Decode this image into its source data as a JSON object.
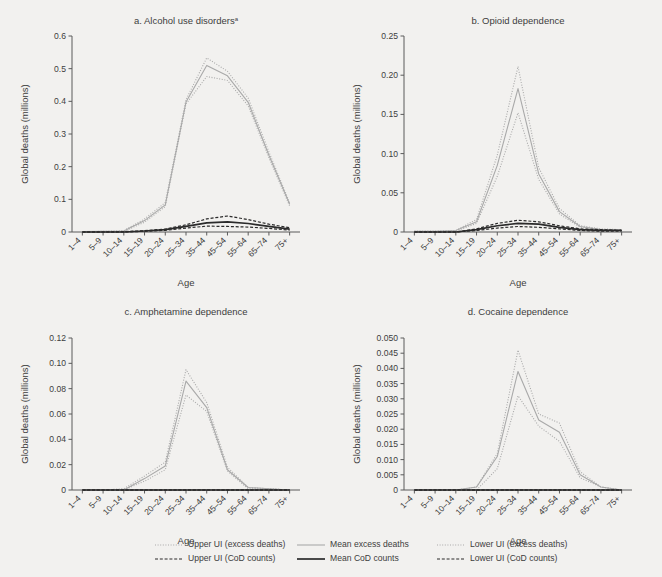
{
  "figure": {
    "background_color": "#f2f1ef",
    "axis_color": "#5a5a5a",
    "text_color": "#3d3d3d",
    "excess_color": "#a9a9a9",
    "cod_color": "#2b2b2b",
    "x_axis_label": "Age",
    "y_axis_label": "Global deaths (millions)",
    "categories": [
      "1–4",
      "5–9",
      "10–14",
      "15–19",
      "20–24",
      "25–34",
      "35–44",
      "45–54",
      "55–64",
      "65–74",
      "75+"
    ]
  },
  "legend": {
    "items": [
      {
        "label": "Upper UI (excess deaths)",
        "style": "dotted",
        "color": "#a9a9a9",
        "icon": "dotted-line-icon"
      },
      {
        "label": "Mean excess deaths",
        "style": "solid-thin",
        "color": "#a9a9a9",
        "icon": "solid-line-icon"
      },
      {
        "label": "Lower UI (excess deaths)",
        "style": "dotted",
        "color": "#a9a9a9",
        "icon": "dotted-line-icon"
      },
      {
        "label": "Upper UI (CoD counts)",
        "style": "dashed",
        "color": "#2b2b2b",
        "icon": "dashed-line-icon"
      },
      {
        "label": "Mean CoD counts",
        "style": "solid-thick",
        "color": "#2b2b2b",
        "icon": "solid-line-icon"
      },
      {
        "label": "Lower UI (CoD counts)",
        "style": "dashed",
        "color": "#2b2b2b",
        "icon": "dashed-line-icon"
      }
    ]
  },
  "chart_data": [
    {
      "id": "panel-a",
      "type": "line",
      "title": "a. Alcohol use disorders",
      "title_superscript": "a",
      "xlabel": "Age",
      "ylabel": "Global deaths (millions)",
      "categories": [
        "1–4",
        "5–9",
        "10–14",
        "15–19",
        "20–24",
        "25–34",
        "35–44",
        "45–54",
        "55–64",
        "65–74",
        "75+"
      ],
      "ylim": [
        0,
        0.6
      ],
      "yticks": [
        0,
        0.1,
        0.2,
        0.3,
        0.4,
        0.5,
        0.6
      ],
      "ytick_labels": [
        "0",
        "0.1",
        "0.2",
        "0.3",
        "0.4",
        "0.5",
        "0.6"
      ],
      "grid": false,
      "series": [
        {
          "name": "Upper UI (excess deaths)",
          "style": "dotted",
          "color": "#a9a9a9",
          "values": [
            0.001,
            0.002,
            0.004,
            0.04,
            0.09,
            0.405,
            0.533,
            0.492,
            0.41,
            0.245,
            0.09
          ]
        },
        {
          "name": "Mean excess deaths",
          "style": "solid-thin",
          "color": "#a9a9a9",
          "values": [
            0.001,
            0.002,
            0.003,
            0.035,
            0.083,
            0.398,
            0.51,
            0.478,
            0.397,
            0.235,
            0.085
          ]
        },
        {
          "name": "Lower UI (excess deaths)",
          "style": "dotted",
          "color": "#a9a9a9",
          "values": [
            0.001,
            0.001,
            0.002,
            0.03,
            0.078,
            0.392,
            0.476,
            0.464,
            0.386,
            0.228,
            0.08
          ]
        },
        {
          "name": "Upper UI (CoD counts)",
          "style": "dashed",
          "color": "#2b2b2b",
          "values": [
            0.0,
            0.0,
            0.001,
            0.004,
            0.009,
            0.022,
            0.04,
            0.049,
            0.038,
            0.024,
            0.013
          ]
        },
        {
          "name": "Mean CoD counts",
          "style": "solid-thick",
          "color": "#2b2b2b",
          "values": [
            0.0,
            0.0,
            0.0,
            0.003,
            0.007,
            0.017,
            0.028,
            0.031,
            0.026,
            0.017,
            0.009
          ]
        },
        {
          "name": "Lower UI (CoD counts)",
          "style": "dashed",
          "color": "#2b2b2b",
          "values": [
            0.0,
            0.0,
            0.0,
            0.002,
            0.005,
            0.012,
            0.018,
            0.017,
            0.015,
            0.011,
            0.006
          ]
        }
      ]
    },
    {
      "id": "panel-b",
      "type": "line",
      "title": "b. Opioid dependence",
      "title_superscript": "",
      "xlabel": "Age",
      "ylabel": "Global deaths (millions)",
      "categories": [
        "1–4",
        "5–9",
        "10–14",
        "15–19",
        "20–24",
        "25–34",
        "35–44",
        "45–54",
        "55–64",
        "65–74",
        "75+"
      ],
      "ylim": [
        0,
        0.25
      ],
      "yticks": [
        0,
        0.05,
        0.1,
        0.15,
        0.2,
        0.25
      ],
      "ytick_labels": [
        "0",
        "0.05",
        "0.10",
        "0.15",
        "0.20",
        "0.25"
      ],
      "grid": false,
      "series": [
        {
          "name": "Upper UI (excess deaths)",
          "style": "dotted",
          "color": "#a9a9a9",
          "values": [
            0.001,
            0.001,
            0.002,
            0.016,
            0.098,
            0.211,
            0.082,
            0.03,
            0.008,
            0.004,
            0.003
          ]
        },
        {
          "name": "Mean excess deaths",
          "style": "solid-thin",
          "color": "#a9a9a9",
          "values": [
            0.001,
            0.001,
            0.002,
            0.013,
            0.085,
            0.183,
            0.074,
            0.026,
            0.007,
            0.003,
            0.002
          ]
        },
        {
          "name": "Lower UI (excess deaths)",
          "style": "dotted",
          "color": "#a9a9a9",
          "values": [
            0.001,
            0.001,
            0.001,
            0.011,
            0.071,
            0.152,
            0.067,
            0.023,
            0.006,
            0.003,
            0.002
          ]
        },
        {
          "name": "Upper UI (CoD counts)",
          "style": "dashed",
          "color": "#2b2b2b",
          "values": [
            0.0,
            0.0,
            0.0,
            0.004,
            0.011,
            0.015,
            0.013,
            0.008,
            0.004,
            0.003,
            0.002
          ]
        },
        {
          "name": "Mean CoD counts",
          "style": "solid-thick",
          "color": "#2b2b2b",
          "values": [
            0.0,
            0.0,
            0.0,
            0.003,
            0.008,
            0.011,
            0.01,
            0.006,
            0.003,
            0.002,
            0.002
          ]
        },
        {
          "name": "Lower UI (CoD counts)",
          "style": "dashed",
          "color": "#2b2b2b",
          "values": [
            0.0,
            0.0,
            0.0,
            0.002,
            0.005,
            0.007,
            0.006,
            0.004,
            0.002,
            0.001,
            0.001
          ]
        }
      ]
    },
    {
      "id": "panel-c",
      "type": "line",
      "title": "c. Amphetamine dependence",
      "title_superscript": "",
      "xlabel": "Age",
      "ylabel": "Global deaths (millions)",
      "categories": [
        "1–4",
        "5–9",
        "10–14",
        "15–19",
        "20–24",
        "25–34",
        "35–44",
        "45–54",
        "55–64",
        "65–74",
        "75+"
      ],
      "ylim": [
        0,
        0.12
      ],
      "yticks": [
        0,
        0.02,
        0.04,
        0.06,
        0.08,
        0.1,
        0.12
      ],
      "ytick_labels": [
        "0",
        "0.02",
        "0.04",
        "0.06",
        "0.08",
        "0.10",
        "0.12"
      ],
      "grid": false,
      "series": [
        {
          "name": "Upper UI (excess deaths)",
          "style": "dotted",
          "color": "#a9a9a9",
          "values": [
            0.0,
            0.0,
            0.001,
            0.011,
            0.022,
            0.095,
            0.069,
            0.018,
            0.002,
            0.001,
            0.0
          ]
        },
        {
          "name": "Mean excess deaths",
          "style": "solid-thin",
          "color": "#a9a9a9",
          "values": [
            0.0,
            0.0,
            0.0,
            0.009,
            0.019,
            0.086,
            0.065,
            0.016,
            0.002,
            0.001,
            0.0
          ]
        },
        {
          "name": "Lower UI (excess deaths)",
          "style": "dotted",
          "color": "#a9a9a9",
          "values": [
            0.0,
            0.0,
            0.0,
            0.007,
            0.016,
            0.075,
            0.062,
            0.015,
            0.001,
            0.001,
            0.0
          ]
        },
        {
          "name": "Upper UI (CoD counts)",
          "style": "dashed",
          "color": "#2b2b2b",
          "values": [
            0.0,
            0.0,
            0.0,
            0.0,
            0.0,
            0.0,
            0.0,
            0.0,
            0.0,
            0.0,
            0.0
          ]
        },
        {
          "name": "Mean CoD counts",
          "style": "solid-thick",
          "color": "#2b2b2b",
          "values": [
            0.0,
            0.0,
            0.0,
            0.0,
            0.0,
            0.0,
            0.0,
            0.0,
            0.0,
            0.0,
            0.0
          ]
        },
        {
          "name": "Lower UI (CoD counts)",
          "style": "dashed",
          "color": "#2b2b2b",
          "values": [
            0.0,
            0.0,
            0.0,
            0.0,
            0.0,
            0.0,
            0.0,
            0.0,
            0.0,
            0.0,
            0.0
          ]
        }
      ]
    },
    {
      "id": "panel-d",
      "type": "line",
      "title": "d. Cocaine dependence",
      "title_superscript": "",
      "xlabel": "Age",
      "ylabel": "Global deaths (millions)",
      "categories": [
        "1–4",
        "5–9",
        "10–14",
        "15–19",
        "20–24",
        "25–34",
        "35–44",
        "45–54",
        "55–64",
        "65–74",
        "75+"
      ],
      "ylim": [
        0,
        0.05
      ],
      "yticks": [
        0,
        0.005,
        0.01,
        0.015,
        0.02,
        0.025,
        0.03,
        0.035,
        0.04,
        0.045,
        0.05
      ],
      "ytick_labels": [
        "0",
        "0.005",
        "0.010",
        "0.015",
        "0.020",
        "0.025",
        "0.030",
        "0.035",
        "0.040",
        "0.045",
        "0.050"
      ],
      "grid": false,
      "series": [
        {
          "name": "Upper UI (excess deaths)",
          "style": "dotted",
          "color": "#a9a9a9",
          "values": [
            0.0,
            0.0,
            0.0,
            0.001,
            0.012,
            0.046,
            0.025,
            0.022,
            0.006,
            0.001,
            0.0
          ]
        },
        {
          "name": "Mean excess deaths",
          "style": "solid-thin",
          "color": "#a9a9a9",
          "values": [
            0.0,
            0.0,
            0.0,
            0.001,
            0.011,
            0.039,
            0.023,
            0.019,
            0.005,
            0.001,
            0.0
          ]
        },
        {
          "name": "Lower UI (excess deaths)",
          "style": "dotted",
          "color": "#a9a9a9",
          "values": [
            0.0,
            0.0,
            0.0,
            0.0,
            0.007,
            0.031,
            0.021,
            0.016,
            0.004,
            0.001,
            0.0
          ]
        },
        {
          "name": "Upper UI (CoD counts)",
          "style": "dashed",
          "color": "#2b2b2b",
          "values": [
            0.0,
            0.0,
            0.0,
            0.0,
            0.0,
            0.0,
            0.0,
            0.0,
            0.0,
            0.0,
            0.0
          ]
        },
        {
          "name": "Mean CoD counts",
          "style": "solid-thick",
          "color": "#2b2b2b",
          "values": [
            0.0,
            0.0,
            0.0,
            0.0,
            0.0,
            0.0,
            0.0,
            0.0,
            0.0,
            0.0,
            0.0
          ]
        },
        {
          "name": "Lower UI (CoD counts)",
          "style": "dashed",
          "color": "#2b2b2b",
          "values": [
            0.0,
            0.0,
            0.0,
            0.0,
            0.0,
            0.0,
            0.0,
            0.0,
            0.0,
            0.0,
            0.0
          ]
        }
      ]
    }
  ]
}
